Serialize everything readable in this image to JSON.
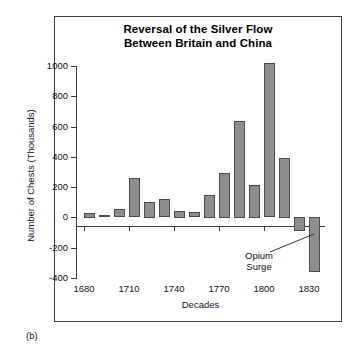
{
  "figure": {
    "panel_label": "(b)",
    "title_line1": "Reversal of the Silver Flow",
    "title_line2": "Between Britain and China",
    "annotation_line1": "Opium",
    "annotation_line2": "Surge",
    "bar_color": "#8e8e8e",
    "bar_edge_color": "#4a4a4a",
    "axis_color": "#3b3b3b",
    "background": "#ffffff"
  },
  "chart_data": {
    "type": "bar",
    "title": "Reversal of the Silver Flow Between Britain and China",
    "xlabel": "Decades",
    "ylabel": "Number of Chests (Thousands)",
    "ylim": [
      -400,
      1000
    ],
    "xlim": [
      1675,
      1840
    ],
    "grid": false,
    "legend": false,
    "ytick_labels": [
      "1000",
      "800",
      "600",
      "400",
      "200",
      "0",
      "-200",
      "-400"
    ],
    "ytick_values": [
      1000,
      800,
      600,
      400,
      200,
      0,
      -200,
      -400
    ],
    "xtick_labels": [
      "1680",
      "1710",
      "1740",
      "1770",
      "1800",
      "1830"
    ],
    "xtick_values": [
      1680,
      1710,
      1740,
      1770,
      1800,
      1830
    ],
    "categories": [
      "1680",
      "1690",
      "1700",
      "1710",
      "1720",
      "1730",
      "1740",
      "1750",
      "1760",
      "1770",
      "1780",
      "1790",
      "1800",
      "1810",
      "1820",
      "1830"
    ],
    "values": [
      30,
      15,
      55,
      260,
      105,
      120,
      45,
      35,
      150,
      295,
      640,
      215,
      1020,
      395,
      -95,
      -360
    ],
    "annotations": [
      {
        "text": "Opium Surge",
        "points_to_category": "1820",
        "value": -95
      }
    ]
  }
}
